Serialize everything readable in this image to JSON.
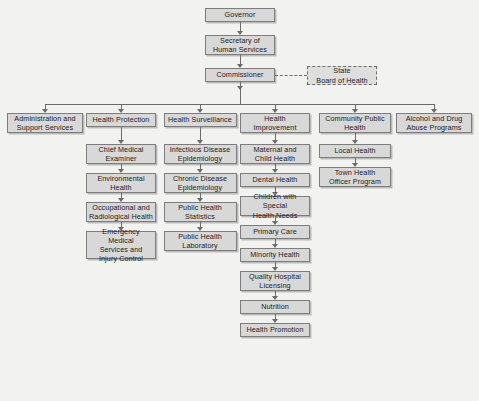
{
  "nodes": {
    "governor": "Governor",
    "secretary": "Secretary of\nHuman Services",
    "commissioner": "Commissioner",
    "state_board": "State\nBoard of Health"
  },
  "divisions": [
    {
      "label": "Administration and\nSupport Services",
      "children": []
    },
    {
      "label": "Health Protection",
      "children": [
        "Chief Medical\nExaminer",
        "Environmental\nHealth",
        "Occupational and\nRadiological Health",
        "Emergency Medical\nServices and\nInjury Control"
      ]
    },
    {
      "label": "Health Surveillance",
      "children": [
        "Infectious Disease\nEpidemiology",
        "Chronic Disease\nEpidemiology",
        "Public Health\nStatistics",
        "Public Health\nLaboratory"
      ]
    },
    {
      "label": "Health\nImprovement",
      "children": [
        "Maternal and\nChild Health",
        "Dental Health",
        "Children with Special\nHealth Needs",
        "Primary Care",
        "Minority Health",
        "Quality Hospital\nLicensing",
        "Nutrition",
        "Health Promotion"
      ]
    },
    {
      "label": "Community Public\nHealth",
      "children": [
        "Local Health",
        "Town Health\nOfficer Program"
      ]
    },
    {
      "label": "Alcohol and Drug\nAbuse Programs",
      "children": []
    }
  ],
  "colors": {
    "box_fill": "#d8d8d8",
    "box_border": "#7d7d7d",
    "connector": "#6b6b6b",
    "background": "#f2f2f0"
  }
}
